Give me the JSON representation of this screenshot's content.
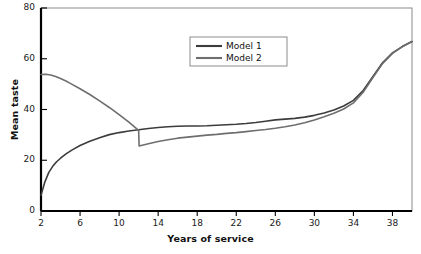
{
  "chart_data": {
    "type": "line",
    "title": "",
    "xlabel": "Years of service",
    "ylabel": "Mean taste",
    "xlim": [
      2,
      40
    ],
    "ylim": [
      0,
      80
    ],
    "xticks": [
      2,
      6,
      10,
      14,
      18,
      22,
      26,
      30,
      34,
      38
    ],
    "yticks": [
      0,
      20,
      40,
      60,
      80
    ],
    "xtick_labels": [
      "2",
      "6",
      "10",
      "14",
      "18",
      "22",
      "26",
      "30",
      "34",
      "38"
    ],
    "ytick_labels": [
      "0",
      "20",
      "40",
      "60",
      "80"
    ],
    "grid": false,
    "legend_position": "upper center",
    "series": [
      {
        "name": "Model 1",
        "color": "#3c3c3c",
        "x": [
          2,
          2.4,
          2.8,
          3.2,
          3.6,
          4,
          4.6,
          5.2,
          6,
          7,
          8,
          9,
          10,
          11,
          12,
          13,
          14,
          15,
          16,
          17,
          18,
          19,
          20,
          21,
          22,
          23,
          24,
          25,
          26,
          27,
          28,
          29,
          30,
          31,
          32,
          33,
          34,
          35,
          36,
          37,
          38,
          39,
          40
        ],
        "y": [
          6.2,
          11.5,
          15.2,
          17.6,
          19.4,
          20.8,
          22.6,
          24.1,
          25.8,
          27.5,
          28.9,
          30.1,
          30.9,
          31.5,
          32.0,
          32.5,
          32.9,
          33.2,
          33.4,
          33.5,
          33.5,
          33.6,
          33.8,
          34.0,
          34.2,
          34.5,
          34.9,
          35.4,
          35.9,
          36.2,
          36.5,
          37.0,
          37.7,
          38.6,
          39.8,
          41.4,
          43.6,
          47.5,
          53.0,
          58.5,
          62.3,
          64.8,
          66.8
        ]
      },
      {
        "name": "Model 2",
        "color": "#6e6e6e",
        "x": [
          2,
          2.5,
          3,
          3.5,
          4,
          4.5,
          5,
          6,
          7,
          8,
          9,
          10,
          11,
          12,
          12.05,
          13,
          14,
          15,
          16,
          17,
          18,
          19,
          20,
          21,
          22,
          23,
          24,
          25,
          26,
          27,
          28,
          29,
          30,
          31,
          32,
          33,
          34,
          35,
          36,
          37,
          38,
          39,
          40
        ],
        "y": [
          53.8,
          53.9,
          53.6,
          53.0,
          52.2,
          51.3,
          50.3,
          48.2,
          45.9,
          43.4,
          40.8,
          38.0,
          35.0,
          31.8,
          25.6,
          26.5,
          27.4,
          28.1,
          28.7,
          29.1,
          29.5,
          29.9,
          30.2,
          30.6,
          30.9,
          31.3,
          31.7,
          32.1,
          32.6,
          33.2,
          33.9,
          34.8,
          35.9,
          37.1,
          38.5,
          40.2,
          42.6,
          46.8,
          52.6,
          58.2,
          62.1,
          64.7,
          66.8
        ]
      }
    ],
    "annotations": []
  },
  "legend": {
    "entries": [
      {
        "label": "Model 1"
      },
      {
        "label": "Model 2"
      }
    ]
  },
  "axes": {
    "x_title": "Years of service",
    "y_title": "Mean taste"
  },
  "style": {
    "model1_color": "#3c3c3c",
    "model2_color": "#6e6e6e",
    "axis_color": "#000000",
    "background": "#ffffff",
    "legend_border": "#8c8c8c"
  }
}
